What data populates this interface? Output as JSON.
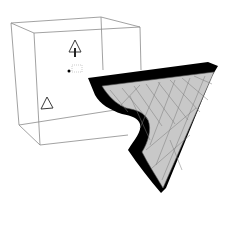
{
  "viewport": {
    "label": "",
    "background_color": "#ffffff"
  },
  "scene": {
    "bounding_box": {
      "kind": "wireframe-box",
      "edge_color": "#8a8a8a"
    },
    "object": {
      "kind": "extruded-triangle-with-notch",
      "face_color": "#c8c8c8",
      "edge_color": "#000000",
      "mesh_color": "#7a7a7a"
    },
    "gizmos": [
      {
        "icon": "triangle-marker-icon",
        "selected": true
      },
      {
        "icon": "triangle-marker-icon",
        "selected": false
      },
      {
        "icon": "pivot-handle-icon",
        "selected": false
      }
    ]
  }
}
